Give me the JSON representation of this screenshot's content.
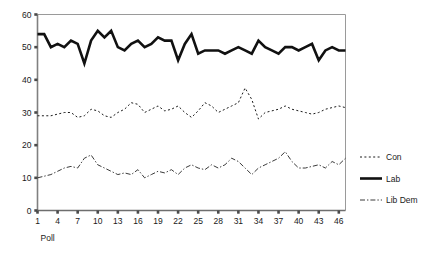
{
  "chart_data": {
    "type": "line",
    "title": "",
    "xlabel": "Poll",
    "ylabel": "",
    "xlim": [
      1,
      47
    ],
    "ylim": [
      0,
      60
    ],
    "grid": false,
    "legend_position": "right",
    "x_ticks": [
      1,
      4,
      7,
      10,
      13,
      16,
      19,
      22,
      25,
      28,
      31,
      34,
      37,
      40,
      43,
      46
    ],
    "y_ticks": [
      0,
      10,
      20,
      30,
      40,
      50,
      60
    ],
    "x": [
      1,
      2,
      3,
      4,
      5,
      6,
      7,
      8,
      9,
      10,
      11,
      12,
      13,
      14,
      15,
      16,
      17,
      18,
      19,
      20,
      21,
      22,
      23,
      24,
      25,
      26,
      27,
      28,
      29,
      30,
      31,
      32,
      33,
      34,
      35,
      36,
      37,
      38,
      39,
      40,
      41,
      42,
      43,
      44,
      45,
      46,
      47
    ],
    "series": [
      {
        "name": "Con",
        "style": "dotted",
        "color": "#1a1a1a",
        "width": 1,
        "values": [
          29,
          29,
          29,
          29.5,
          30,
          30,
          28.5,
          29,
          31,
          30.5,
          29,
          28.5,
          30,
          31,
          33,
          32.5,
          30,
          31,
          32,
          30.5,
          31,
          32,
          30,
          28.5,
          30.5,
          33,
          32,
          30,
          31,
          32,
          33,
          37.5,
          34,
          28,
          30,
          30.5,
          31,
          32,
          31,
          30.5,
          30,
          29.5,
          30,
          31,
          31.5,
          32,
          31.5
        ]
      },
      {
        "name": "Lab",
        "style": "solid-thick",
        "color": "#111111",
        "width": 2.6,
        "values": [
          54,
          54,
          50,
          51,
          50,
          52,
          51,
          45,
          52,
          55,
          53,
          55,
          50,
          49,
          51,
          52,
          50,
          51,
          53,
          52,
          52,
          46,
          51,
          54,
          48,
          49,
          49,
          49,
          48,
          49,
          50,
          49,
          48,
          52,
          50,
          49,
          48,
          50,
          50,
          49,
          50,
          51,
          46,
          49,
          50,
          49,
          49
        ]
      },
      {
        "name": "Lib Dem",
        "style": "dash-dot",
        "color": "#3a3a3a",
        "width": 1,
        "values": [
          10,
          10.5,
          11,
          12,
          13,
          13.5,
          13,
          16,
          17,
          14,
          13,
          12,
          11,
          11.5,
          11,
          12.5,
          10,
          11,
          12,
          11.5,
          12.5,
          11,
          13,
          14,
          13,
          12.5,
          14,
          13,
          14,
          16,
          15,
          13,
          11,
          13,
          14,
          15,
          16,
          18,
          15,
          13,
          13,
          13.5,
          14,
          13,
          15,
          14,
          16
        ]
      }
    ]
  },
  "legend": {
    "items": [
      {
        "label": "Con"
      },
      {
        "label": "Lab"
      },
      {
        "label": "Lib Dem"
      }
    ]
  }
}
